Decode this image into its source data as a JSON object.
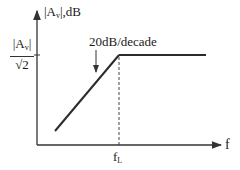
{
  "diagram": {
    "type": "bode-magnitude-low-frequency-asymptote",
    "y_axis": {
      "label_main": "|A",
      "label_sub": "v",
      "label_tail": "|,dB"
    },
    "x_axis": {
      "label": "f"
    },
    "y_tick": {
      "numerator_main": "|A",
      "numerator_sub": "v",
      "numerator_tail": "|",
      "denominator": "√2"
    },
    "slope_annotation": "20dB/decade",
    "corner_frequency": {
      "label_main": "f",
      "label_sub": "L"
    },
    "curve": {
      "segments": [
        {
          "name": "rising-asymptote",
          "slope_db_per_decade": 20
        },
        {
          "name": "flat-midband",
          "slope_db_per_decade": 0
        }
      ]
    },
    "colors": {
      "line": "#2b2b2b",
      "axis": "#333333",
      "background": "#ffffff"
    }
  }
}
